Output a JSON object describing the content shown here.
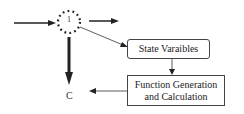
{
  "diagram": {
    "node": {
      "label": "1",
      "style": "dotted-circle"
    },
    "output_label": "C",
    "boxes": {
      "state": {
        "label": "State Varaibles"
      },
      "function": {
        "label": "Function Generation and Calculation"
      }
    },
    "edges": [
      {
        "from": "left-input",
        "to": "node"
      },
      {
        "from": "node",
        "to": "right-output"
      },
      {
        "from": "node",
        "to": "C",
        "style": "thick"
      },
      {
        "from": "node",
        "to": "state"
      },
      {
        "from": "state",
        "to": "function"
      },
      {
        "from": "function",
        "to": "C"
      }
    ],
    "colors": {
      "line": "#222222",
      "background": "#ffffff"
    }
  }
}
